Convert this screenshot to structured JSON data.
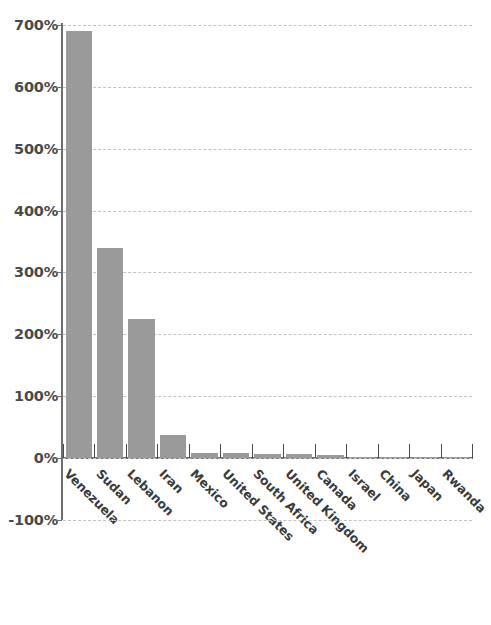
{
  "chart_data": {
    "type": "bar",
    "title": "",
    "subtitle": "",
    "xlabel": "",
    "ylabel": "",
    "categories": [
      "Venezuela",
      "Sudan",
      "Lebanon",
      "Iran",
      "Mexico",
      "United States",
      "South Africa",
      "United Kingdom",
      "Canada",
      "Israel",
      "China",
      "Japan",
      "Rwanda"
    ],
    "values": [
      690,
      340,
      225,
      37,
      8,
      8,
      7,
      6,
      5,
      2,
      1,
      1,
      1
    ],
    "value_suffix": "%",
    "ylim": [
      -100,
      700
    ],
    "ytick_values": [
      700,
      600,
      500,
      400,
      300,
      200,
      100,
      0,
      -100
    ],
    "ytick_labels": [
      "700%",
      "600%",
      "500%",
      "400%",
      "300%",
      "200%",
      "100%",
      "0%",
      "-100%"
    ],
    "grid": true,
    "grid_style": "dashed-horizontal",
    "legend": "none",
    "bar_color": "#9a9a9a",
    "axis_color": "#6e6e6e",
    "grid_color": "#c2c2c2",
    "label_color": "#3b3b3b",
    "xtick_label_rotation": 45
  }
}
